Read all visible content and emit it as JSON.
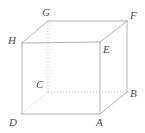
{
  "figure": {
    "kind": "cube-diagram",
    "colors": {
      "background": "#ffffff",
      "visible_edge": "#b0b0b0",
      "hidden_edge": "#bdbdbd",
      "label": "#4a4a4a"
    },
    "vertices": [
      {
        "id": "A",
        "label": "A",
        "x": 100,
        "y": 114,
        "label_x": 96,
        "label_y": 117,
        "hidden": false
      },
      {
        "id": "B",
        "label": "B",
        "x": 127,
        "y": 92,
        "label_x": 130,
        "label_y": 88,
        "hidden": false
      },
      {
        "id": "C",
        "label": "C",
        "x": 48,
        "y": 92,
        "label_x": 36,
        "label_y": 79,
        "hidden": true
      },
      {
        "id": "D",
        "label": "D",
        "x": 22,
        "y": 114,
        "label_x": 9,
        "label_y": 117,
        "hidden": false
      },
      {
        "id": "E",
        "label": "E",
        "x": 100,
        "y": 42,
        "label_x": 103,
        "label_y": 44,
        "hidden": false
      },
      {
        "id": "F",
        "label": "F",
        "x": 127,
        "y": 21,
        "label_x": 130,
        "label_y": 10,
        "hidden": false
      },
      {
        "id": "G",
        "label": "G",
        "x": 48,
        "y": 21,
        "label_x": 42,
        "label_y": 7,
        "hidden": false
      },
      {
        "id": "H",
        "label": "H",
        "x": 22,
        "y": 43,
        "label_x": 8,
        "label_y": 35,
        "hidden": false
      }
    ],
    "edges": [
      {
        "from": "D",
        "to": "A",
        "hidden": false,
        "name": "edge-DA"
      },
      {
        "from": "A",
        "to": "B",
        "hidden": false,
        "name": "edge-AB"
      },
      {
        "from": "D",
        "to": "H",
        "hidden": false,
        "name": "edge-DH"
      },
      {
        "from": "A",
        "to": "E",
        "hidden": false,
        "name": "edge-AE"
      },
      {
        "from": "B",
        "to": "F",
        "hidden": false,
        "name": "edge-BF"
      },
      {
        "from": "H",
        "to": "E",
        "hidden": false,
        "name": "edge-HE"
      },
      {
        "from": "E",
        "to": "F",
        "hidden": false,
        "name": "edge-EF"
      },
      {
        "from": "H",
        "to": "G",
        "hidden": false,
        "name": "edge-HG"
      },
      {
        "from": "G",
        "to": "F",
        "hidden": false,
        "name": "edge-GF"
      },
      {
        "from": "C",
        "to": "D",
        "hidden": true,
        "name": "edge-CD"
      },
      {
        "from": "C",
        "to": "B",
        "hidden": true,
        "name": "edge-CB"
      },
      {
        "from": "C",
        "to": "G",
        "hidden": true,
        "name": "edge-CG"
      }
    ]
  }
}
